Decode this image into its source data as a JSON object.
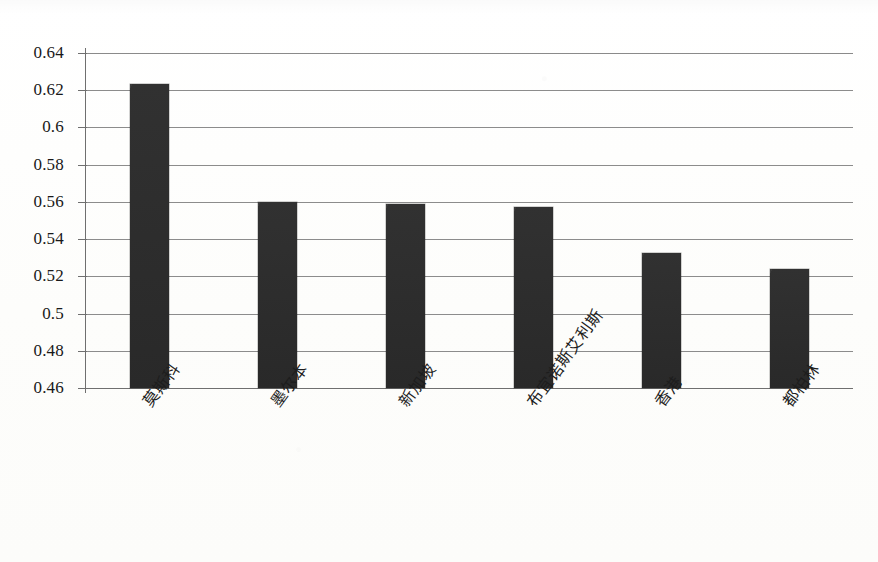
{
  "chart_data": {
    "type": "bar",
    "title": "",
    "subtitle": "",
    "xlabel": "",
    "ylabel": "",
    "categories": [
      "莫斯科",
      "墨尔本",
      "新加坡",
      "布宜诺斯艾利斯",
      "香港",
      "都柏林"
    ],
    "values": [
      0.6235,
      0.56,
      0.5588,
      0.5573,
      0.5325,
      0.5237
    ],
    "ylim": [
      0.46,
      0.64
    ],
    "ytick_labels": [
      "0.64",
      "0.62",
      "0.6",
      "0.58",
      "0.56",
      "0.54",
      "0.52",
      "0.5",
      "0.48",
      "0.46"
    ],
    "ytick_values": [
      0.64,
      0.62,
      0.6,
      0.58,
      0.56,
      0.54,
      0.52,
      0.5,
      0.48,
      0.46
    ],
    "grid": true,
    "grid_axis": "y",
    "legend": false,
    "legend_position": "none",
    "bar_color": "#2b2b2b",
    "grid_color": "#8c8c8c",
    "axis_color": "#6f6f6f",
    "background_color": "#fdfdfc",
    "x_tick_label_rotation": -54
  }
}
